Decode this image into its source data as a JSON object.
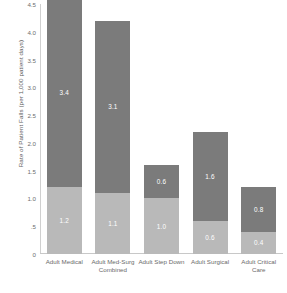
{
  "chart_data": {
    "type": "bar",
    "title": "",
    "xlabel": "",
    "ylabel": "Rate of Patient Falls (per 1,000 patient days)",
    "ylim": [
      0,
      4.5
    ],
    "ytick_labels": [
      "4.5",
      "4.0",
      "3.5",
      "3.0",
      "2.5",
      "2.0",
      "1.5",
      "1.0",
      ".5",
      "0"
    ],
    "ytick_values": [
      4.5,
      4.0,
      3.5,
      3.0,
      2.5,
      2.0,
      1.5,
      1.0,
      0.5,
      0.0
    ],
    "grid": false,
    "legend_position": "none",
    "stacked": true,
    "categories": [
      "Adult Medical",
      "Adult Med-Surg Combined",
      "Adult Step Down",
      "Adult Surgical",
      "Adult Critical Care"
    ],
    "series": [
      {
        "name": "lower-segment",
        "color": "#b9b9b9",
        "values": [
          1.2,
          1.1,
          1.0,
          0.6,
          0.4
        ],
        "labels": [
          "1.2",
          "1.1",
          "1.0",
          "0.6",
          "0.4"
        ]
      },
      {
        "name": "upper-segment",
        "color": "#7b7b7b",
        "values": [
          3.4,
          3.1,
          0.6,
          1.6,
          0.8
        ],
        "labels": [
          "3.4",
          "3.1",
          "0.6",
          "1.6",
          "0.8"
        ]
      }
    ],
    "totals": [
      4.6,
      4.2,
      1.6,
      2.2,
      1.2
    ]
  },
  "colors": {
    "lower_segment": "#b9b9b9",
    "upper_segment": "#7b7b7b",
    "axis": "#c8c8c8",
    "tick_text": "#6e6e6e",
    "label_text": "#6a6a6a",
    "bar_label_text": "#ffffff",
    "background": "#ffffff"
  }
}
